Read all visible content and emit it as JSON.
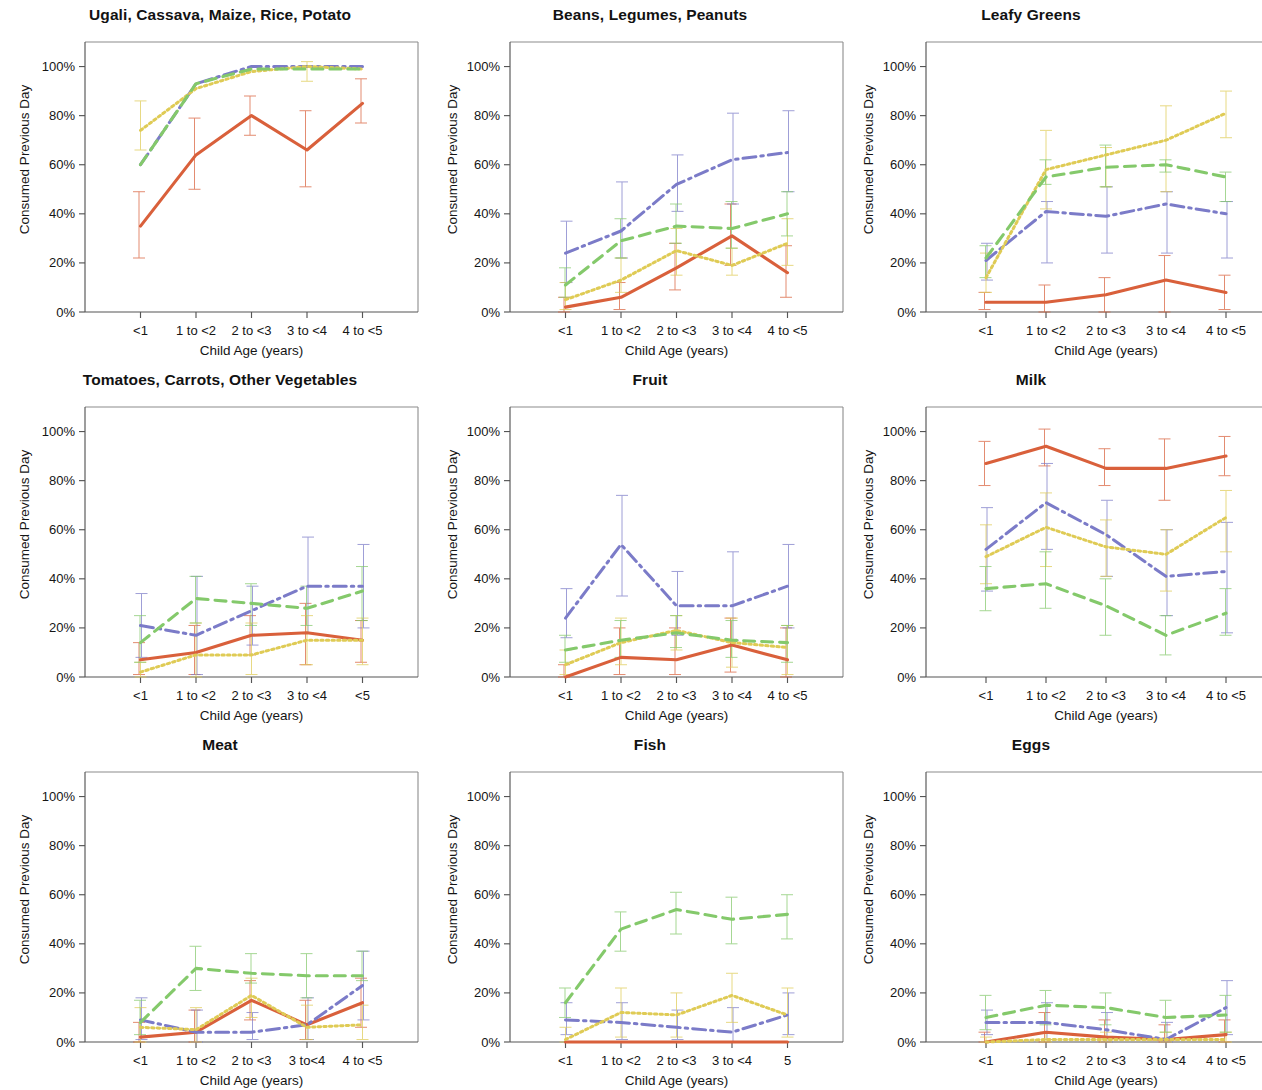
{
  "figure": {
    "ylabel": "Consumed Previous Day",
    "xlabel": "Child Age (years)",
    "ytick_labels": [
      "0%",
      "20%",
      "40%",
      "60%",
      "80%",
      "100%"
    ],
    "ytick_values": [
      0,
      20,
      40,
      60,
      80,
      100
    ],
    "colors": {
      "orange": "#D9603B",
      "blue": "#7B7BC8",
      "yellow": "#DFCB55",
      "green": "#84C96B"
    }
  },
  "chart_data": [
    {
      "type": "line",
      "title": "Ugali, Cassava, Maize, Rice, Potato",
      "xlabel": "Child Age (years)",
      "ylabel": "Consumed Previous Day",
      "categories": [
        "<1",
        "1 to <2",
        "2 to <3",
        "3 to <4",
        "4 to <5"
      ],
      "ylim": [
        0,
        110
      ],
      "grid": false,
      "legend": "none",
      "series": [
        {
          "name": "orange",
          "style": "solid",
          "values": [
            35,
            64,
            80,
            66,
            85
          ],
          "err_low": [
            22,
            50,
            72,
            51,
            77
          ],
          "err_high": [
            49,
            79,
            88,
            82,
            95
          ]
        },
        {
          "name": "blue",
          "style": "dashdot",
          "values": [
            60,
            93,
            100,
            100,
            100
          ],
          "err_low": [
            null,
            null,
            null,
            null,
            null
          ],
          "err_high": [
            null,
            null,
            null,
            null,
            null
          ]
        },
        {
          "name": "yellow",
          "style": "dotted",
          "values": [
            74,
            91,
            98,
            100,
            99
          ],
          "err_low": [
            66,
            null,
            null,
            94,
            null
          ],
          "err_high": [
            86,
            null,
            null,
            102,
            null
          ]
        },
        {
          "name": "green",
          "style": "dashed",
          "values": [
            60,
            93,
            99,
            99,
            99
          ],
          "err_low": [
            null,
            null,
            null,
            null,
            null
          ],
          "err_high": [
            null,
            null,
            null,
            null,
            null
          ]
        }
      ]
    },
    {
      "type": "line",
      "title": "Beans, Legumes, Peanuts",
      "xlabel": "Child Age (years)",
      "ylabel": "Consumed Previous Day",
      "categories": [
        "<1",
        "1 to <2",
        "2 to <3",
        "3 to <4",
        "4 to <5"
      ],
      "ylim": [
        0,
        110
      ],
      "grid": false,
      "legend": "none",
      "series": [
        {
          "name": "orange",
          "style": "solid",
          "values": [
            2,
            6,
            18,
            31,
            16
          ],
          "err_low": [
            0,
            1,
            9,
            19,
            6
          ],
          "err_high": [
            6,
            12,
            28,
            44,
            27
          ]
        },
        {
          "name": "blue",
          "style": "dashdot",
          "values": [
            24,
            33,
            52,
            62,
            65
          ],
          "err_low": [
            12,
            22,
            41,
            44,
            49
          ],
          "err_high": [
            37,
            53,
            64,
            81,
            82
          ]
        },
        {
          "name": "yellow",
          "style": "dotted",
          "values": [
            5,
            13,
            25,
            19,
            28
          ],
          "err_low": [
            1,
            8,
            15,
            15,
            19
          ],
          "err_high": [
            12,
            22,
            34,
            26,
            38
          ]
        },
        {
          "name": "green",
          "style": "dashed",
          "values": [
            11,
            29,
            35,
            34,
            40
          ],
          "err_low": [
            6,
            22,
            28,
            26,
            31
          ],
          "err_high": [
            18,
            38,
            44,
            45,
            49
          ]
        }
      ]
    },
    {
      "type": "line",
      "title": "Leafy Greens",
      "xlabel": "Child Age (years)",
      "ylabel": "Consumed Previous Day",
      "categories": [
        "<1",
        "1 to <2",
        "2 to <3",
        "3 to <4",
        "4 to <5"
      ],
      "ylim": [
        0,
        110
      ],
      "grid": false,
      "legend": "none",
      "series": [
        {
          "name": "orange",
          "style": "solid",
          "values": [
            4,
            4,
            7,
            13,
            8
          ],
          "err_low": [
            1,
            0,
            0,
            0,
            1
          ],
          "err_high": [
            8,
            11,
            14,
            23,
            15
          ]
        },
        {
          "name": "blue",
          "style": "dashdot",
          "values": [
            21,
            41,
            39,
            44,
            40
          ],
          "err_low": [
            13,
            20,
            24,
            24,
            22
          ],
          "err_high": [
            28,
            45,
            51,
            49,
            45
          ]
        },
        {
          "name": "yellow",
          "style": "dotted",
          "values": [
            14,
            58,
            64,
            70,
            81
          ],
          "err_low": [
            8,
            42,
            51,
            49,
            71
          ],
          "err_high": [
            24,
            74,
            67,
            84,
            90
          ]
        },
        {
          "name": "green",
          "style": "dashed",
          "values": [
            22,
            55,
            59,
            60,
            55
          ],
          "err_low": [
            14,
            52,
            51,
            57,
            45
          ],
          "err_high": [
            27,
            62,
            68,
            62,
            57
          ]
        }
      ]
    },
    {
      "type": "line",
      "title": "Tomatoes, Carrots, Other Vegetables",
      "xlabel": "Child Age (years)",
      "ylabel": "Consumed Previous Day",
      "categories": [
        "<1",
        "1 to <2",
        "2 to <3",
        "3 to <4",
        "<5"
      ],
      "ylim": [
        0,
        110
      ],
      "grid": false,
      "legend": "none",
      "series": [
        {
          "name": "orange",
          "style": "solid",
          "values": [
            7,
            10,
            17,
            18,
            15
          ],
          "err_low": [
            1,
            1,
            9,
            5,
            6
          ],
          "err_high": [
            14,
            21,
            25,
            30,
            23
          ]
        },
        {
          "name": "blue",
          "style": "dashdot",
          "values": [
            21,
            17,
            27,
            37,
            37
          ],
          "err_low": [
            8,
            1,
            13,
            18,
            20
          ],
          "err_high": [
            34,
            41,
            37,
            57,
            54
          ]
        },
        {
          "name": "yellow",
          "style": "dotted",
          "values": [
            2,
            9,
            9,
            15,
            15
          ],
          "err_low": [
            0,
            0,
            1,
            5,
            5
          ],
          "err_high": [
            6,
            22,
            22,
            25,
            24
          ]
        },
        {
          "name": "green",
          "style": "dashed",
          "values": [
            14,
            32,
            30,
            28,
            35
          ],
          "err_low": [
            6,
            22,
            21,
            21,
            23
          ],
          "err_high": [
            25,
            41,
            38,
            37,
            45
          ]
        }
      ]
    },
    {
      "type": "line",
      "title": "Fruit",
      "xlabel": "Child Age (years)",
      "ylabel": "Consumed Previous Day",
      "categories": [
        "<1",
        "1 to <2",
        "2 to <3",
        "3 to <4",
        "4 to <5"
      ],
      "ylim": [
        0,
        110
      ],
      "grid": false,
      "legend": "none",
      "series": [
        {
          "name": "orange",
          "style": "solid",
          "values": [
            0,
            8,
            7,
            13,
            7
          ],
          "err_low": [
            0,
            1,
            1,
            2,
            0
          ],
          "err_high": [
            5,
            20,
            20,
            24,
            20
          ]
        },
        {
          "name": "blue",
          "style": "dashdot",
          "values": [
            24,
            54,
            29,
            29,
            37
          ],
          "err_low": [
            16,
            33,
            17,
            15,
            20
          ],
          "err_high": [
            36,
            74,
            43,
            51,
            54
          ]
        },
        {
          "name": "yellow",
          "style": "dotted",
          "values": [
            5,
            14,
            19,
            14,
            12
          ],
          "err_low": [
            1,
            5,
            11,
            4,
            1
          ],
          "err_high": [
            11,
            24,
            25,
            24,
            21
          ]
        },
        {
          "name": "green",
          "style": "dashed",
          "values": [
            11,
            15,
            18,
            15,
            14
          ],
          "err_low": [
            6,
            8,
            12,
            8,
            6
          ],
          "err_high": [
            17,
            23,
            25,
            23,
            21
          ]
        }
      ]
    },
    {
      "type": "line",
      "title": "Milk",
      "xlabel": "Child Age (years)",
      "ylabel": "Consumed Previous Day",
      "categories": [
        "<1",
        "1 to <2",
        "2 to <3",
        "3 to <4",
        "4 to <5"
      ],
      "ylim": [
        0,
        110
      ],
      "grid": false,
      "legend": "none",
      "series": [
        {
          "name": "orange",
          "style": "solid",
          "values": [
            87,
            94,
            85,
            85,
            90
          ],
          "err_low": [
            78,
            86,
            78,
            72,
            82
          ],
          "err_high": [
            96,
            101,
            93,
            97,
            98
          ]
        },
        {
          "name": "blue",
          "style": "dashdot",
          "values": [
            52,
            71,
            58,
            41,
            43
          ],
          "err_low": [
            35,
            52,
            41,
            25,
            18
          ],
          "err_high": [
            69,
            87,
            72,
            60,
            63
          ]
        },
        {
          "name": "yellow",
          "style": "dotted",
          "values": [
            49,
            61,
            53,
            50,
            65
          ],
          "err_low": [
            38,
            45,
            41,
            35,
            51
          ],
          "err_high": [
            62,
            75,
            64,
            60,
            76
          ]
        },
        {
          "name": "green",
          "style": "dashed",
          "values": [
            36,
            38,
            29,
            17,
            26
          ],
          "err_low": [
            27,
            28,
            17,
            9,
            17
          ],
          "err_high": [
            45,
            51,
            40,
            25,
            36
          ]
        }
      ]
    },
    {
      "type": "line",
      "title": "Meat",
      "xlabel": "Child Age (years)",
      "ylabel": "Consumed Previous Day",
      "categories": [
        "<1",
        "1 to <2",
        "2 to <3",
        "3 to<4",
        "4 to <5"
      ],
      "ylim": [
        0,
        110
      ],
      "grid": false,
      "legend": "none",
      "series": [
        {
          "name": "orange",
          "style": "solid",
          "values": [
            2,
            4,
            17,
            7,
            16
          ],
          "err_low": [
            0,
            0,
            9,
            1,
            6
          ],
          "err_high": [
            8,
            13,
            25,
            17,
            26
          ]
        },
        {
          "name": "blue",
          "style": "dashdot",
          "values": [
            9,
            4,
            4,
            7,
            23
          ],
          "err_low": [
            1,
            0,
            1,
            1,
            9
          ],
          "err_high": [
            18,
            13,
            12,
            18,
            37
          ]
        },
        {
          "name": "yellow",
          "style": "dotted",
          "values": [
            6,
            5,
            19,
            6,
            7
          ],
          "err_low": [
            0,
            0,
            10,
            1,
            1
          ],
          "err_high": [
            14,
            14,
            26,
            15,
            15
          ]
        },
        {
          "name": "green",
          "style": "dashed",
          "values": [
            8,
            30,
            28,
            27,
            27
          ],
          "err_low": [
            3,
            21,
            24,
            18,
            25
          ],
          "err_high": [
            17,
            39,
            36,
            36,
            37
          ]
        }
      ]
    },
    {
      "type": "line",
      "title": "Fish",
      "xlabel": "Child Age (years)",
      "ylabel": "Consumed Previous Day",
      "categories": [
        "<1",
        "1 to <2",
        "2 to <3",
        "3 to <4",
        "5"
      ],
      "ylim": [
        0,
        110
      ],
      "grid": false,
      "legend": "none",
      "series": [
        {
          "name": "orange",
          "style": "solid",
          "values": [
            0,
            0,
            0,
            0,
            0
          ],
          "err_low": [
            0,
            0,
            0,
            0,
            0
          ],
          "err_high": [
            0,
            0,
            0,
            0,
            0
          ]
        },
        {
          "name": "blue",
          "style": "dashdot",
          "values": [
            9,
            8,
            6,
            4,
            11
          ],
          "err_low": [
            3,
            1,
            1,
            0,
            3
          ],
          "err_high": [
            16,
            16,
            13,
            14,
            20
          ]
        },
        {
          "name": "yellow",
          "style": "dotted",
          "values": [
            1,
            12,
            11,
            19,
            11
          ],
          "err_low": [
            0,
            2,
            2,
            8,
            2
          ],
          "err_high": [
            6,
            22,
            20,
            28,
            22
          ]
        },
        {
          "name": "green",
          "style": "dashed",
          "values": [
            16,
            46,
            54,
            50,
            52
          ],
          "err_low": [
            10,
            37,
            44,
            40,
            42
          ],
          "err_high": [
            22,
            53,
            61,
            59,
            60
          ]
        }
      ]
    },
    {
      "type": "line",
      "title": "Eggs",
      "xlabel": "Child Age (years)",
      "ylabel": "Consumed Previous Day",
      "categories": [
        "<1",
        "1 to <2",
        "2 to <3",
        "3 to <4",
        "4 to <5"
      ],
      "ylim": [
        0,
        110
      ],
      "grid": false,
      "legend": "none",
      "series": [
        {
          "name": "orange",
          "style": "solid",
          "values": [
            0,
            4,
            2,
            1,
            3
          ],
          "err_low": [
            0,
            0,
            0,
            0,
            0
          ],
          "err_high": [
            4,
            12,
            9,
            7,
            9
          ]
        },
        {
          "name": "blue",
          "style": "dashdot",
          "values": [
            8,
            8,
            5,
            1,
            14
          ],
          "err_low": [
            3,
            1,
            0,
            0,
            3
          ],
          "err_high": [
            13,
            16,
            12,
            8,
            25
          ]
        },
        {
          "name": "yellow",
          "style": "dotted",
          "values": [
            0,
            1,
            1,
            1,
            1
          ],
          "err_low": [
            0,
            0,
            0,
            0,
            0
          ],
          "err_high": [
            2,
            4,
            4,
            4,
            4
          ]
        },
        {
          "name": "green",
          "style": "dashed",
          "values": [
            10,
            15,
            14,
            10,
            11
          ],
          "err_low": [
            5,
            7,
            7,
            4,
            4
          ],
          "err_high": [
            19,
            21,
            20,
            17,
            19
          ]
        }
      ]
    }
  ]
}
